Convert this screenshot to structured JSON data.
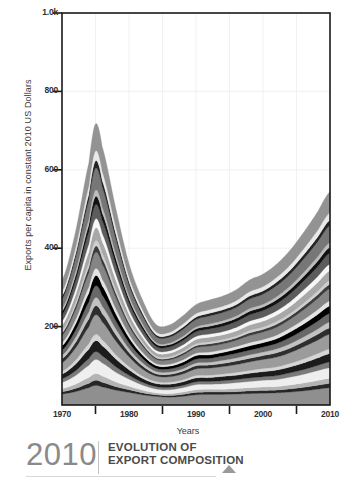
{
  "figure": {
    "title_year": "2010",
    "title_line1": "EVOLUTION OF",
    "title_line2": "EXPORT COMPOSITION"
  },
  "chart_data": {
    "type": "area",
    "stacked": true,
    "title": "EVOLUTION OF EXPORT COMPOSITION",
    "xlabel": "Years",
    "ylabel": "Exports per capita in constant 2010 US Dollars",
    "xlim": [
      1970,
      2010
    ],
    "ylim": [
      0,
      1000
    ],
    "xticks": [
      1970,
      1980,
      1990,
      2000,
      2010
    ],
    "xticklabels": [
      "1970",
      "1980",
      "1990",
      "2000",
      "2010"
    ],
    "minor_xticks": [
      1975,
      1985,
      1995,
      2005
    ],
    "yticks": [
      200,
      400,
      600,
      800,
      1000
    ],
    "yticklabels": [
      "200",
      "400",
      "600",
      "800",
      "1.0k"
    ],
    "grid": true,
    "legend": "none",
    "x": [
      1970,
      1972,
      1974,
      1975,
      1976,
      1978,
      1980,
      1982,
      1984,
      1986,
      1988,
      1990,
      1992,
      1994,
      1996,
      1998,
      2000,
      2002,
      2004,
      2006,
      2008,
      2010
    ],
    "series": [
      {
        "name": "layer-01",
        "color": "#8f8f8f",
        "values": [
          28,
          34,
          44,
          50,
          46,
          38,
          32,
          26,
          22,
          20,
          22,
          26,
          27,
          27,
          28,
          29,
          30,
          31,
          33,
          36,
          40,
          44
        ]
      },
      {
        "name": "layer-02",
        "color": "#272727",
        "values": [
          6,
          8,
          11,
          13,
          12,
          9,
          7,
          5,
          4,
          4,
          5,
          6,
          6,
          6,
          6,
          7,
          7,
          7,
          8,
          9,
          10,
          11
        ]
      },
      {
        "name": "layer-03",
        "color": "#b4b4b4",
        "values": [
          8,
          11,
          15,
          17,
          16,
          12,
          9,
          7,
          5,
          5,
          6,
          7,
          7,
          7,
          8,
          8,
          9,
          9,
          10,
          11,
          12,
          13
        ]
      },
      {
        "name": "layer-04",
        "color": "#efefef",
        "values": [
          16,
          22,
          31,
          36,
          33,
          25,
          18,
          13,
          10,
          10,
          11,
          13,
          13,
          14,
          15,
          16,
          17,
          18,
          20,
          22,
          25,
          27
        ]
      },
      {
        "name": "layer-05",
        "color": "#7a7a7a",
        "values": [
          9,
          12,
          17,
          20,
          18,
          14,
          10,
          7,
          6,
          6,
          6,
          7,
          7,
          8,
          8,
          9,
          9,
          10,
          11,
          12,
          13,
          15
        ]
      },
      {
        "name": "layer-06",
        "color": "#1c1c1c",
        "values": [
          12,
          17,
          24,
          28,
          26,
          20,
          14,
          10,
          8,
          8,
          9,
          10,
          10,
          11,
          11,
          12,
          13,
          14,
          15,
          17,
          19,
          21
        ]
      },
      {
        "name": "layer-07",
        "color": "#d6d6d6",
        "values": [
          7,
          10,
          14,
          16,
          15,
          11,
          8,
          6,
          5,
          5,
          5,
          6,
          6,
          6,
          7,
          7,
          8,
          8,
          9,
          10,
          11,
          12
        ]
      },
      {
        "name": "layer-08",
        "color": "#9b9b9b",
        "values": [
          22,
          31,
          43,
          50,
          46,
          35,
          25,
          18,
          14,
          14,
          15,
          17,
          18,
          19,
          20,
          22,
          23,
          25,
          27,
          31,
          34,
          38
        ]
      },
      {
        "name": "layer-09",
        "color": "#2e2e2e",
        "values": [
          10,
          14,
          20,
          23,
          21,
          16,
          11,
          8,
          6,
          6,
          7,
          8,
          8,
          8,
          9,
          9,
          10,
          11,
          12,
          13,
          15,
          16
        ]
      },
      {
        "name": "layer-10",
        "color": "#c2c2c2",
        "values": [
          9,
          13,
          18,
          21,
          19,
          15,
          10,
          8,
          6,
          6,
          6,
          7,
          7,
          8,
          8,
          9,
          9,
          10,
          11,
          12,
          13,
          15
        ]
      },
      {
        "name": "layer-11",
        "color": "#686868",
        "values": [
          13,
          18,
          26,
          30,
          28,
          21,
          15,
          11,
          8,
          8,
          9,
          10,
          10,
          11,
          12,
          12,
          13,
          14,
          16,
          18,
          20,
          22
        ]
      },
      {
        "name": "layer-12",
        "color": "#000000",
        "values": [
          11,
          16,
          22,
          26,
          24,
          18,
          13,
          9,
          7,
          7,
          8,
          9,
          9,
          9,
          10,
          11,
          11,
          12,
          14,
          15,
          17,
          19
        ]
      },
      {
        "name": "layer-13",
        "color": "#e4e4e4",
        "values": [
          8,
          11,
          16,
          18,
          17,
          13,
          9,
          7,
          5,
          5,
          6,
          6,
          7,
          7,
          7,
          8,
          8,
          9,
          10,
          11,
          12,
          13
        ]
      },
      {
        "name": "layer-14",
        "color": "#858585",
        "values": [
          18,
          25,
          35,
          41,
          38,
          29,
          20,
          15,
          11,
          11,
          12,
          14,
          15,
          15,
          16,
          18,
          19,
          20,
          22,
          25,
          28,
          31
        ]
      },
      {
        "name": "layer-15",
        "color": "#3c3c3c",
        "values": [
          7,
          10,
          14,
          16,
          15,
          11,
          8,
          6,
          4,
          4,
          5,
          5,
          6,
          6,
          6,
          7,
          7,
          8,
          8,
          9,
          10,
          11
        ]
      },
      {
        "name": "layer-16",
        "color": "#cfcfcf",
        "values": [
          6,
          8,
          12,
          14,
          13,
          10,
          7,
          5,
          4,
          4,
          4,
          5,
          5,
          5,
          5,
          6,
          6,
          7,
          7,
          8,
          9,
          10
        ]
      },
      {
        "name": "layer-17",
        "color": "#a8a8a8",
        "values": [
          14,
          20,
          28,
          33,
          30,
          23,
          16,
          12,
          9,
          9,
          10,
          11,
          12,
          12,
          13,
          14,
          15,
          16,
          18,
          20,
          22,
          25
        ]
      },
      {
        "name": "layer-18",
        "color": "#f7f7f7",
        "values": [
          10,
          14,
          20,
          23,
          21,
          16,
          11,
          8,
          6,
          6,
          7,
          8,
          8,
          8,
          9,
          10,
          10,
          11,
          12,
          14,
          15,
          17
        ]
      },
      {
        "name": "layer-19",
        "color": "#5c5c5c",
        "values": [
          16,
          22,
          31,
          36,
          33,
          25,
          18,
          13,
          10,
          10,
          11,
          12,
          13,
          14,
          15,
          16,
          17,
          18,
          20,
          22,
          25,
          28
        ]
      },
      {
        "name": "layer-20",
        "color": "#111111",
        "values": [
          9,
          13,
          18,
          21,
          19,
          15,
          10,
          8,
          6,
          6,
          6,
          7,
          7,
          8,
          8,
          9,
          9,
          10,
          11,
          12,
          14,
          15
        ]
      },
      {
        "name": "layer-21",
        "color": "#bdbdbd",
        "values": [
          7,
          10,
          14,
          16,
          15,
          11,
          8,
          6,
          4,
          4,
          5,
          5,
          6,
          6,
          6,
          7,
          7,
          8,
          9,
          10,
          11,
          12
        ]
      },
      {
        "name": "layer-22",
        "color": "#777777",
        "values": [
          24,
          34,
          48,
          56,
          51,
          39,
          27,
          20,
          15,
          15,
          17,
          19,
          20,
          21,
          22,
          24,
          26,
          28,
          30,
          34,
          38,
          43
        ]
      },
      {
        "name": "layer-23",
        "color": "#242424",
        "values": [
          8,
          11,
          16,
          19,
          17,
          13,
          9,
          7,
          5,
          5,
          6,
          6,
          7,
          7,
          7,
          8,
          8,
          9,
          10,
          11,
          12,
          14
        ]
      },
      {
        "name": "layer-24",
        "color": "#e9e9e9",
        "values": [
          11,
          15,
          21,
          25,
          23,
          17,
          12,
          9,
          7,
          7,
          8,
          9,
          9,
          9,
          10,
          11,
          11,
          12,
          13,
          15,
          17,
          19
        ]
      },
      {
        "name": "layer-25",
        "color": "#939393",
        "values": [
          30,
          42,
          59,
          69,
          63,
          48,
          34,
          25,
          19,
          19,
          21,
          23,
          25,
          26,
          28,
          30,
          32,
          34,
          38,
          42,
          47,
          53
        ]
      }
    ]
  }
}
